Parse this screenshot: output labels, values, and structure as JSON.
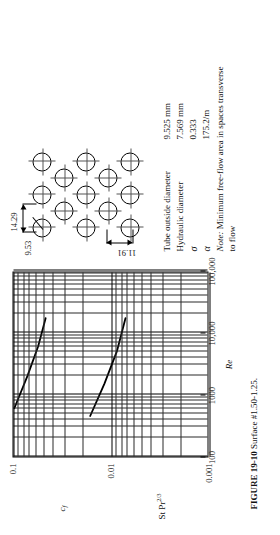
{
  "figure": {
    "caption_title": "FIGURE 19-10",
    "caption_text": "Surface #1.50-1.25."
  },
  "chart_data": {
    "type": "line",
    "title": "",
    "xlabel": "Re",
    "ylabel": "c_f  /  St Pr^{2/3}",
    "xscale": "log",
    "yscale": "log",
    "xlim": [
      100,
      100000
    ],
    "ylim": [
      0.001,
      0.1
    ],
    "grid": "log-log minor grid on",
    "xtick_labels": [
      "100",
      "1000",
      "10,000",
      "100,000"
    ],
    "xtick_values": [
      100,
      1000,
      10000,
      100000
    ],
    "ytick_labels": [
      "0.1",
      "0.01",
      "0.001"
    ],
    "ytick_values": [
      0.1,
      0.01,
      0.001
    ],
    "series": [
      {
        "name": "c_f",
        "label": "c_f",
        "points": [
          [
            600,
            0.098
          ],
          [
            2000,
            0.072
          ],
          [
            6000,
            0.056
          ],
          [
            17000,
            0.047
          ]
        ]
      },
      {
        "name": "St Pr 2/3",
        "label": "St Pr^{2/3}",
        "points": [
          [
            450,
            0.0165
          ],
          [
            1500,
            0.0118
          ],
          [
            5000,
            0.0088
          ],
          [
            17000,
            0.0072
          ]
        ]
      }
    ],
    "legend": "none",
    "axis_titles": {
      "x": "Re",
      "y_upper": "c",
      "y_upper_sub": "f",
      "y_lower": "St Pr",
      "y_lower_sup": "2/3"
    }
  },
  "tube_diagram": {
    "name": "staggered-tube-bank",
    "dim_tube_diameter": "9.53",
    "dim_transverse_pitch": "14.29",
    "dim_longitudinal_pitch": "11.91",
    "rows": 5,
    "cols": 3
  },
  "parameters": {
    "rows": [
      {
        "name": "Tube outside diameter",
        "value": "9.525 mm"
      },
      {
        "name": "Hydraulic diameter",
        "value": "7.569 mm"
      },
      {
        "name": "σ",
        "value": "0.333"
      },
      {
        "name": "α",
        "value": "175.2/m"
      }
    ],
    "note_label": "Note:",
    "note_text": " Minimum free-flow area in spaces transverse to flow"
  }
}
